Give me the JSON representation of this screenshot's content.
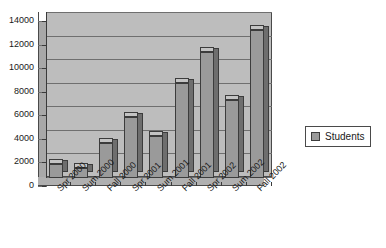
{
  "chart_data": {
    "type": "bar",
    "title": "",
    "subtitle": "",
    "xlabel": "",
    "ylabel": "",
    "categories": [
      "Spr 2000",
      "Sum 2000",
      "Fall 2000",
      "Spr 2001",
      "Sum 2001",
      "Fall 2001",
      "Spr 2002",
      "Sum 2002",
      "Fall 2002"
    ],
    "series": [
      {
        "name": "Students",
        "values": [
          1200,
          850,
          3000,
          5200,
          3600,
          8100,
          10700,
          6600,
          12600
        ],
        "color": "#9a9a9a"
      }
    ],
    "ylim": [
      0,
      14000
    ],
    "ytick_values": [
      0,
      2000,
      4000,
      6000,
      8000,
      10000,
      12000,
      14000
    ],
    "ytick_labels": [
      "0",
      "2000",
      "4000",
      "6000",
      "8000",
      "10000",
      "12000",
      "14000"
    ],
    "grid": true,
    "grid_axis": "y",
    "legend": {
      "position": "right",
      "entries": [
        "Students"
      ]
    },
    "style": {
      "three_d": true,
      "plot_area_color": "#bdbdbd",
      "gridline_color": "#6f6f6f",
      "axis_color": "#3a3a3a",
      "bar_color": "#9a9a9a",
      "bar_side_color": "#6e6e6e",
      "bar_top_color": "#c4c4c4",
      "background_color": "#ffffff"
    }
  }
}
